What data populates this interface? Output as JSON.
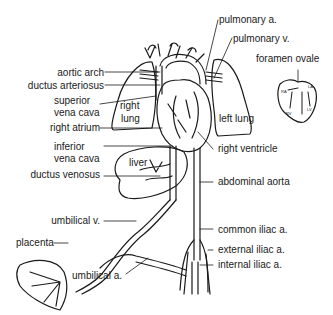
{
  "diagram": {
    "labels": {
      "aortic_arch": "aortic arch",
      "ductus_arteriosus": "ductus arteriosus",
      "superior_vena_cava_1": "superior",
      "superior_vena_cava_2": "vena cava",
      "right_atrium": "right atrium",
      "inferior_vena_cava_1": "inferior",
      "inferior_vena_cava_2": "vena cava",
      "ductus_venosus": "ductus venosus",
      "umbilical_v": "umbilical v.",
      "placenta": "placenta",
      "umbilical_a": "umbilical a.",
      "pulmonary_a": "pulmonary a.",
      "pulmonary_v": "pulmonary v.",
      "foramen_ovale": "foramen ovale",
      "left_lung": "left lung",
      "right_lung_1": "right",
      "right_lung_2": "lung",
      "right_ventricle": "right ventricle",
      "abdominal_aorta": "abdominal aorta",
      "common_iliac_a": "common iliac a.",
      "external_iliac_a": "external iliac a.",
      "internal_iliac_a": "internal iliac a.",
      "liver": "liver"
    },
    "inset": {
      "ra": "RA",
      "la": "LA",
      "rv": "RV",
      "lv": "LV"
    },
    "colors": {
      "line": "#1a1a1a",
      "background": "#ffffff"
    }
  }
}
